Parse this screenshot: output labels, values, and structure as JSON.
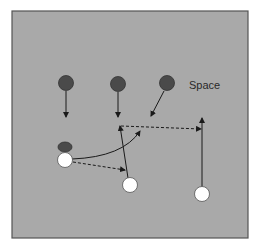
{
  "diagram": {
    "type": "soccer-tactic",
    "background_color": "#a9a9a9",
    "border_color": "#555555",
    "annotations": [
      {
        "id": "space-label",
        "text": "Space",
        "x": 189,
        "y": 89
      }
    ],
    "defenders": [
      {
        "id": "defender-1",
        "x": 66,
        "y": 83,
        "r": 7.5,
        "color": "#4a4a4a"
      },
      {
        "id": "defender-2",
        "x": 118,
        "y": 84,
        "r": 7.5,
        "color": "#4a4a4a"
      },
      {
        "id": "defender-3",
        "x": 167,
        "y": 83,
        "r": 7.5,
        "color": "#4a4a4a"
      }
    ],
    "attackers": [
      {
        "id": "attacker-ball-carrier",
        "x": 65,
        "y": 160,
        "r": 7.5,
        "color": "#ffffff"
      },
      {
        "id": "attacker-2",
        "x": 130,
        "y": 185,
        "r": 7.5,
        "color": "#ffffff"
      },
      {
        "id": "attacker-3",
        "x": 202,
        "y": 194,
        "r": 7.5,
        "color": "#ffffff"
      }
    ],
    "ball": {
      "x": 65,
      "y": 147,
      "rx": 7,
      "ry": 5,
      "color": "#4a4a4a"
    },
    "movements": [
      {
        "id": "defender-1-run",
        "style": "solid",
        "from": [
          66,
          91
        ],
        "to": [
          66,
          117
        ]
      },
      {
        "id": "defender-2-run",
        "style": "solid",
        "from": [
          118,
          92
        ],
        "to": [
          118,
          117
        ]
      },
      {
        "id": "defender-3-run",
        "style": "solid",
        "from": [
          164,
          91
        ],
        "to": [
          151,
          116
        ]
      },
      {
        "id": "attacker-2-run",
        "style": "solid",
        "from": [
          128,
          178
        ],
        "to": [
          120,
          126
        ]
      },
      {
        "id": "attacker-3-run",
        "style": "solid",
        "from": [
          202,
          187
        ],
        "to": [
          202,
          118
        ]
      },
      {
        "id": "ball-carrier-dribble",
        "style": "solid-curve",
        "from": [
          72,
          159
        ],
        "to": [
          140,
          131
        ]
      }
    ],
    "passes": [
      {
        "id": "pass-to-attacker-2",
        "style": "dashed",
        "from": [
          73,
          162
        ],
        "to": [
          125,
          170
        ]
      },
      {
        "id": "pass-into-space",
        "style": "dashed",
        "from": [
          121,
          126
        ],
        "to": [
          201,
          129
        ]
      }
    ]
  }
}
